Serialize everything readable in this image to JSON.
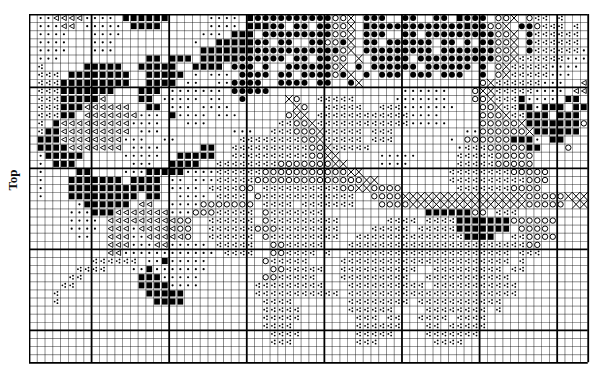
{
  "label": "Top",
  "grid": {
    "cols": 72,
    "rows": 43,
    "cell_w": 7.76,
    "cell_h": 8.1,
    "major_col_offset": 8,
    "major_row_offset": 9,
    "major_every": 10
  },
  "legend_codes": {
    ".": "empty",
    "d": "small-dot",
    "t": "open-triangle",
    "s": "filled-square",
    "c": "filled-circle",
    "o": "open-circle",
    "x": "cross-hatch",
    "k": "three-dot-cluster"
  },
  "colors": {
    "ink": "#000000",
    "grid": "#000000",
    "background": "#ffffff"
  },
  "pattern": [
    ".ddttttdddd.ssssss.....dddd.sccccccccccoox.ccc..cc..cc.sccc.oox.okk.k...ss",
    ".dddtt.ddddd.ssss......dddd.ssscc.cc.ccoox.sccccccccccccsccoox.ccokkk.k..tt",
    ".dddd...dddd..........ddd.sss.cccccccccoox.ccc..cc.cccccccccoox.ckkkkkk.ttt",
    ".dddd...ddd..........d..ssssscc.cc..ccoocx.cc.cccccc.cc.c.ccoox.ckkkkkk.cc.t",
    ".dddd...ddd...........ssssssscccccccccccox.ccccccccc.cccccccoox.ckkkkkkdd.t",
    ".ddd...........ss.sss.ssssscccccc.cc.ccoo.x.ccccc.ccccccccccooxkkkkkkdddd.t",
    ".k.....sssss..sssss..ssss.ccc.c..ccccccox.c.cccccc.cccccc.c.oxkkkkkdddd.tt",
    ".kkk.ssssssss..sssss.d.ddd.cccc.cc.ccccocx.c.ccc.ccc.ccc..c.oxkkkkkddd..tt",
    ".kkksssssssss..ssss.dd..ddcccc..cccc.cc..cx...............oxkkkkkkddd..tt",
    ".kkksssssss...sss.ddddddd.ccccc.................dddddd...oxxkkkkkdddd.tt",
    ".kkkssssst....ss.ddddd.dd..c.....xo..kkkkk.....ddddddd...ooxkkksdddd.ss.o",
    ".kkkssstttttt..ss.ddd.dddd........xo..kkkkk..kkkddddddd...ooxkkssdsss.ssoo",
    ".kkkss.tttttttddd.sdddd.ddd......oxx.kkkkkkkkkkkkdddd.....oooxkksss.sss.o",
    ".k.stttttttttdddd...ddd.........kkooxkkkkkkkkkkkkddddd....oooooxssssssso",
    ".kssttttttttt.ddd.........ddd..kkkoooxkkkkk.kkk.........ddooooooxssssss.o",
    ".sssttttttttddd..dd........kkkkkkkkooxkkkkk.kkk.......d.oooooosssd.ss.",
    ".ssssttttttt.dddd.....ss..kkkkkkkkkkooxkkkkk...........dkkkoooooss...o",
    ".dsssss.....ddddd..sssss..kkkkkkkkkkooxx.....ddddd.....kkkkkooooo....",
    ".d.sss.......ddd..ssss..kkkkkkkkoooooooxx....dddd......kkkkkooooo....",
    ".d....ss....dddsssssddddkkkkkkoooooooooooxx...........kkkkkkkkooooo..",
    ".d...sssssss.ssss.dd.dddkkkkkooooooooooooooxx.........kkkkkkkkkkooo..",
    ".d...ssssssssssss.dddd.kkkkoo.kkkkkkkkkkooxxoooo.......kkkkkkkoooo..",
    ".d...sssssssss.ss..dddd.kkkk.okkkkkkkkkkkk..ooooxxxxxxxxxxxxxxxxoooooxxxxx",
    "......dssssss.tt..ddddooooooo.kkkk.kkkkkkk...ooooxxxxxxxxxxxxxxxooooo.xxxx",
    ".....dddssstttttttdddoookkkkk.okkkkkkk.............ssssssoo.kkk...",
    ".....dddd.tttttttttoo..kkkkkk.okkkkkkkkk......kkkk.kkkksssssssoooooo",
    ".....dddd.tttdtttttoo..kkkkkkoookkkkkkkk....kkkkk.kkkkksssssss.oooo",
    "......dd..tttddttttto..kkkkkk.okkkkkkkkk..kkkkkkkkkkkkkkssss..kkoooo",
    "..........tttdddttddddd.kkkkk..ookkkkk...kkkkkkkkkkkkkkkkkkkkkkkoo",
    "..........ttdddddddddddd.kkkk..ookkkk.k..kkkkkkkkkkkkkkkkkkkkk.kkk",
    "........kkkkkk.ddsddddd.......okkkkk....kkkkkkkkkkkkkkkkkkkkkk.k",
    "......kkkk...ddsddddddd........ookkkkk..kkkkkkkkkk..kkkkkkkkk.kk",
    ".....kk.......sssddddd........ookkkkk...kkkkkkkkk..kkkkkkkkkkk",
    "....kk........ssssdddd.......kkkkkkkkk...kkkkkkkkkk.kkkkkkkkkkk",
    "...k...........sssss.........kkkkkkkkkkk.kkkkkkkkkkkkkkkkkkkkkk",
    "...k............ssss..........kkkk.......kkkkkkkk.kkkkkkkkkkk",
    "..............................kkkkk......kkkkkk....kkkkkkkk.k",
    "..............................kkkkk.......kkk.kk..kkkk.kkkk",
    "..............................kkkk........kkkkkk...kk.kkkkk",
    "...............................kkkk.......kkkkk....kkkkkkk",
    "...............................kkk........kkk.......kkkk",
    "........................................................",
    "........................................................"
  ]
}
